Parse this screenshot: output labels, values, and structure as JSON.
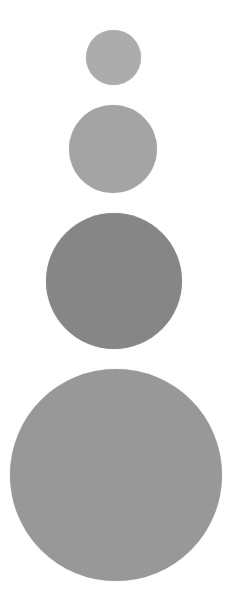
{
  "canvas": {
    "width": 243,
    "height": 615,
    "background": "#ffffff"
  },
  "circles": [
    {
      "label": "circle-1",
      "cx": 113,
      "cy": 57,
      "diameter": 55,
      "color": "#acacac"
    },
    {
      "label": "circle-2",
      "cx": 113,
      "cy": 149,
      "diameter": 88,
      "color": "#a4a4a4"
    },
    {
      "label": "circle-3",
      "cx": 114,
      "cy": 281,
      "diameter": 136,
      "color": "#868686"
    },
    {
      "label": "circle-4",
      "cx": 116,
      "cy": 475,
      "diameter": 212,
      "color": "#989898"
    }
  ]
}
